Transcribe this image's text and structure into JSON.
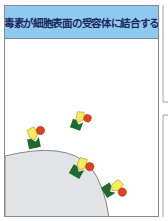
{
  "panel": {
    "title": "毒素が細胞表面の受容体に結合する"
  },
  "colors": {
    "header_bg": "#8ec9f2",
    "cell": "#e1e3e5",
    "receptor": "#1f6b2e",
    "toxin_a": "#f7ec5a",
    "toxin_b": "#e0401e"
  },
  "diagram": {
    "elements": [
      "cell-surface",
      "receptor",
      "toxin-yellow-subunit",
      "toxin-red-subunit"
    ],
    "receptor_toxin_pairs": 4
  }
}
